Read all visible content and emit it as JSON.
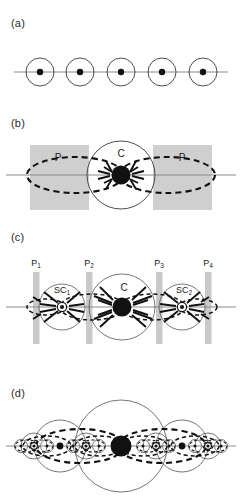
{
  "figure": {
    "background": "#ffffff",
    "ink": "#111111",
    "axis_color": "#8a8a8a",
    "slab_color": "#cfcfcf",
    "bar_color": "#c9c9c9"
  },
  "panels": [
    {
      "id": "a",
      "label": "(a)",
      "label_pos": {
        "x": 11,
        "y": 17
      },
      "description": "row of five equal circles each containing a filled dot, threaded by a horizontal line",
      "axis": {
        "y": 72,
        "x1": 14,
        "x2": 228
      },
      "nodes": [
        {
          "name": "node-1",
          "cx": 40,
          "cy": 72,
          "r": 14,
          "dot_r": 3.2
        },
        {
          "name": "node-2",
          "cx": 80,
          "cy": 72,
          "r": 14,
          "dot_r": 3.2
        },
        {
          "name": "node-3",
          "cx": 121,
          "cy": 72,
          "r": 14,
          "dot_r": 3.2
        },
        {
          "name": "node-4",
          "cx": 162,
          "cy": 72,
          "r": 14,
          "dot_r": 3.2
        },
        {
          "name": "node-5",
          "cx": 203,
          "cy": 72,
          "r": 14,
          "dot_r": 3.2
        }
      ]
    },
    {
      "id": "b",
      "label": "(b)",
      "label_pos": {
        "x": 11,
        "y": 129
      },
      "description": "central circle C with heavy black core, flanked by two grey slabs labelled P, dashed flux loops with arrowheads converging on the core",
      "axis": {
        "y": 175,
        "x1": 6,
        "x2": 236
      },
      "center": {
        "name": "C",
        "cx": 121,
        "cy": 175,
        "r": 34,
        "core_r": 9.5
      },
      "center_label": "C",
      "center_label_pos": {
        "x": 121,
        "y": 157
      },
      "slabs": [
        {
          "name": "slab-left",
          "label": "P",
          "x": 30,
          "y": 145,
          "w": 59,
          "h": 65,
          "label_x": 58,
          "label_y": 161
        },
        {
          "name": "slab-right",
          "label": "P",
          "x": 153,
          "y": 145,
          "w": 59,
          "h": 65,
          "label_x": 182,
          "label_y": 161
        }
      ],
      "loops": [
        {
          "name": "flux-loop-left",
          "cx": 75,
          "cy": 175,
          "rx": 48,
          "ry": 18
        },
        {
          "name": "flux-loop-right",
          "cx": 167,
          "cy": 175,
          "rx": 48,
          "ry": 18
        }
      ]
    },
    {
      "id": "c",
      "label": "(c)",
      "label_pos": {
        "x": 11,
        "y": 238
      },
      "description": "central circle C between two sub-centres SC1 and SC2, four thin grey pillars P1..P4, dashed flux loops and arrowheads converging on each centre",
      "axis": {
        "y": 307,
        "x1": 6,
        "x2": 236
      },
      "pillars": [
        {
          "name": "pillar-p1",
          "label": "P₁",
          "x": 33,
          "y": 272,
          "w": 6.5,
          "h": 72,
          "label_x": 36,
          "label_y": 266
        },
        {
          "name": "pillar-p2",
          "label": "P₂",
          "x": 86,
          "y": 272,
          "w": 6.5,
          "h": 72,
          "label_x": 89,
          "label_y": 266
        },
        {
          "name": "pillar-p3",
          "label": "P₃",
          "x": 156,
          "y": 272,
          "w": 6.5,
          "h": 72,
          "label_x": 159,
          "label_y": 266
        },
        {
          "name": "pillar-p4",
          "label": "P₄",
          "x": 205,
          "y": 272,
          "w": 6.5,
          "h": 72,
          "label_x": 208,
          "label_y": 266
        }
      ],
      "centers": [
        {
          "name": "SC1",
          "label": "SC₁",
          "cx": 62,
          "cy": 307,
          "r": 23,
          "core_r": 4.2,
          "ring": true,
          "label_x": 62,
          "label_y": 293
        },
        {
          "name": "C",
          "label": "C",
          "cx": 122,
          "cy": 307,
          "r": 33,
          "core_r": 9.5,
          "ring": false,
          "label_x": 124,
          "label_y": 291
        },
        {
          "name": "SC2",
          "label": "SC₂",
          "cx": 182,
          "cy": 307,
          "r": 23,
          "core_r": 4.2,
          "ring": true,
          "label_x": 184,
          "label_y": 293
        }
      ],
      "loops": [
        {
          "name": "flux-loop-c-left",
          "cx": 92,
          "cy": 307,
          "rx": 32,
          "ry": 13
        },
        {
          "name": "flux-loop-c-right",
          "cx": 152,
          "cy": 307,
          "rx": 32,
          "ry": 13
        },
        {
          "name": "flux-loop-sc1-left",
          "cx": 46,
          "cy": 307,
          "rx": 19,
          "ry": 8
        },
        {
          "name": "flux-loop-sc2-right",
          "cx": 198,
          "cy": 307,
          "rx": 19,
          "ry": 8
        }
      ]
    },
    {
      "id": "d",
      "label": "(d)",
      "label_pos": {
        "x": 11,
        "y": 394
      },
      "description": "self-similar hierarchy: one large central circle with black core, flanked by progressively smaller nested circles and dashed flux loops at every scale",
      "axis": {
        "y": 446,
        "x1": 6,
        "x2": 236
      },
      "center": {
        "name": "C",
        "cx": 121,
        "cy": 446,
        "r": 46,
        "core_r": 10.5
      },
      "levels": [
        {
          "name": "level-1-large",
          "r": 46,
          "core_r": 10.5,
          "positions": [
            121
          ]
        },
        {
          "name": "level-2-medium",
          "r": 26,
          "core_r": 3.4,
          "positions": [
            60,
            182
          ]
        },
        {
          "name": "level-3-small",
          "r": 13,
          "core_r": 2.2,
          "positions": [
            34,
            86,
            156,
            208
          ]
        },
        {
          "name": "level-4-tiny",
          "r": 6.5,
          "core_r": 1.5,
          "positions": [
            21,
            47,
            73,
            99,
            143,
            169,
            195,
            221
          ]
        }
      ]
    }
  ]
}
